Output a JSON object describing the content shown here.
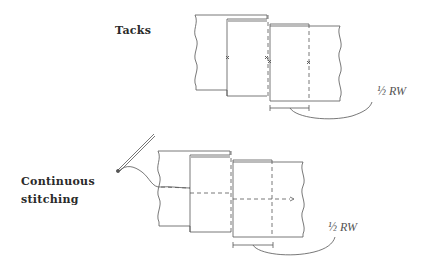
{
  "diagrams": [
    {
      "title": "Tacks",
      "measure_label": "½ RW",
      "markers": "x"
    },
    {
      "title_line1": "Continuous",
      "title_line2": "stitching",
      "measure_label": "½ RW"
    }
  ],
  "colors": {
    "line": "#555555",
    "dash": "#777777",
    "text": "#2a2a2a"
  }
}
